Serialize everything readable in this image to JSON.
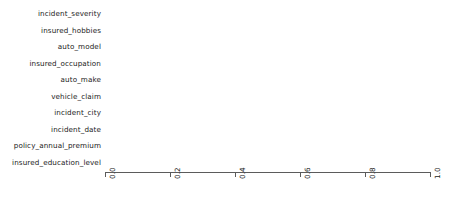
{
  "chart_data": {
    "type": "bar",
    "orientation": "horizontal",
    "title": "",
    "xlabel": "",
    "ylabel": "",
    "xlim": [
      0.0,
      1.0
    ],
    "grid": false,
    "legend": null,
    "bar_color": "#31688e",
    "background_color": "#ffffff",
    "axis_color": "#5b5b5b",
    "xticks": [
      "0.0",
      "0.2",
      "0.4",
      "0.6",
      "0.8",
      "1.0"
    ],
    "xtick_values": [
      0.0,
      0.2,
      0.4,
      0.6,
      0.8,
      1.0
    ],
    "xtick_rotation": 90,
    "categories": [
      "incident_severity",
      "insured_hobbies",
      "auto_model",
      "insured_occupation",
      "auto_make",
      "vehicle_claim",
      "incident_city",
      "incident_date",
      "policy_annual_premium",
      "insured_education_level"
    ],
    "values": [
      1.0,
      0.877,
      0.625,
      0.354,
      0.23,
      0.162,
      0.148,
      0.145,
      0.143,
      0.142
    ]
  }
}
